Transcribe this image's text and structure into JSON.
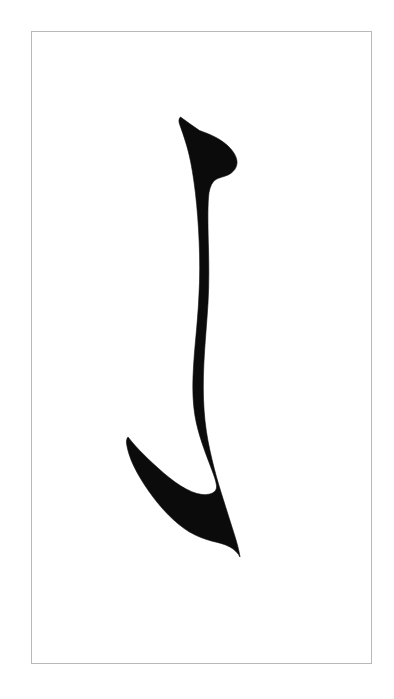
{
  "page": {
    "width": 394,
    "height": 699,
    "background_color": "#ffffff"
  },
  "frame": {
    "name": "paper-frame",
    "left": 31,
    "top": 31,
    "width": 341,
    "height": 633,
    "border_color": "#b9b9b9",
    "border_width": 1,
    "fill_color": "#ffffff"
  },
  "artwork": {
    "kind": "brush-stroke",
    "script": "East Asian calligraphy",
    "stroke_name": "vertical-with-left-sweeping-hook",
    "ink_color": "#0b0b0b",
    "paper_color": "#ffffff",
    "stroke_count": 1,
    "description": "A single black brush stroke: sharp upward-left entry point at top, a heavy rounded shoulder bulging right, a long slightly curved vertical shaft tapering through the middle, then a wide V-shaped hook at the bottom sweeping down-left into a fine tapering tail and ending in a sharp downward point at lower right.",
    "bounding_box": {
      "x": 128,
      "y": 116,
      "width": 112,
      "height": 442
    },
    "key_points": {
      "top_entry_tip": [
        180,
        117
      ],
      "shoulder_right_max": [
        237,
        161
      ],
      "shaft_mid": [
        206,
        300
      ],
      "hook_junction": [
        213,
        487
      ],
      "tail_tip_left": [
        128,
        437
      ],
      "bottom_tip": [
        240,
        557
      ]
    },
    "path_d": "M180.5,117.0 C186.5,121.5 193.0,126.0 199.5,130.5 C208.0,133.5 217.0,137.0 224.5,143.0 C231.5,148.5 236.5,155.0 237.0,161.5 C237.4,167.5 233.5,172.5 228.0,175.0 C222.5,177.5 217.0,177.5 213.5,181.5 C210.5,185.0 209.0,190.5 208.5,197.0 C207.5,212.0 208.0,230.0 208.5,249.0 C209.0,268.0 209.0,286.0 208.0,303.0 C207.0,320.0 205.5,336.0 204.5,352.0 C203.5,368.0 203.0,384.0 203.5,399.0 C204.0,414.0 205.5,428.0 208.0,441.0 C210.5,454.0 213.5,466.0 216.5,477.0 C219.5,487.5 222.5,497.0 225.5,506.5 C228.5,516.0 231.5,525.5 234.5,535.0 C237.0,543.0 239.0,550.0 240.0,557.0 C238.0,553.0 234.5,549.5 230.0,547.0 C224.5,544.0 218.0,542.5 211.5,541.0 C204.0,539.0 196.5,536.0 189.5,532.0 C182.0,527.5 175.0,521.5 168.5,515.0 C161.5,508.0 155.0,500.0 149.0,491.5 C143.0,483.0 137.5,474.0 133.5,465.5 C130.0,458.0 127.5,450.5 126.5,443.5 C126.2,440.8 126.8,438.3 128.0,437.0 C130.0,439.5 132.5,442.5 135.5,446.0 C140.5,451.5 146.5,457.5 153.0,463.5 C160.0,470.0 167.5,476.5 175.0,482.0 C182.5,487.5 190.0,491.5 197.0,493.5 C203.0,495.2 208.5,495.0 212.5,493.0 C215.5,491.5 217.0,489.0 216.5,485.5 C216.0,481.0 214.0,475.5 211.5,469.0 C208.5,461.0 205.0,452.0 202.0,443.0 C199.0,434.0 196.5,425.0 195.0,416.0 C193.0,404.0 192.5,391.0 193.0,377.0 C193.5,362.0 195.0,346.0 196.5,330.0 C198.0,314.0 199.0,298.0 199.5,282.0 C200.0,264.0 199.5,246.0 198.5,229.0 C197.5,212.0 196.0,196.0 194.0,182.0 C192.0,167.5 189.5,155.0 186.5,145.0 C184.0,136.5 181.5,129.5 179.5,124.0 C178.5,121.0 178.8,118.5 180.5,117.0 Z"
  }
}
